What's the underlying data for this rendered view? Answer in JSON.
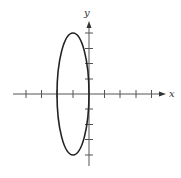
{
  "diagram": {
    "type": "ellipse-on-axes",
    "axes": {
      "x_label": "x",
      "y_label": "y",
      "x_ticks": [
        -4,
        -3,
        -2,
        -1,
        1,
        2,
        3,
        4
      ],
      "y_ticks": [
        -4,
        -3,
        -2,
        -1,
        1,
        2,
        3,
        4
      ]
    },
    "ellipse": {
      "center": [
        -1,
        0
      ],
      "semi_axis_x": 1,
      "semi_axis_y": 4
    },
    "colors": {
      "axis": "#555555",
      "curve": "#222222"
    }
  }
}
